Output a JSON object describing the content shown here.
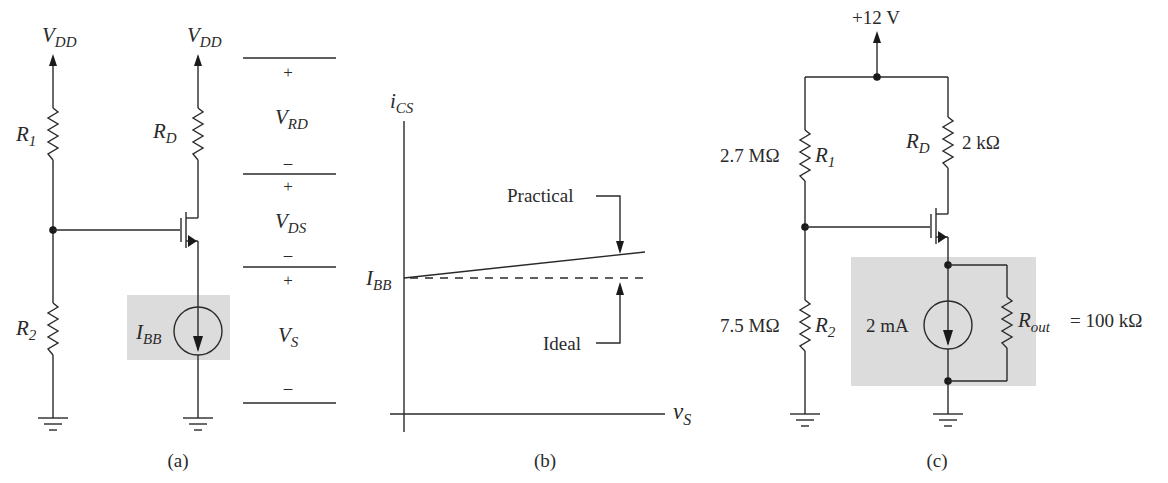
{
  "panel_a": {
    "caption": "(a)",
    "vdd_left": {
      "main": "V",
      "sub": "DD"
    },
    "vdd_right": {
      "main": "V",
      "sub": "DD"
    },
    "r1": {
      "main": "R",
      "sub": "1"
    },
    "r2": {
      "main": "R",
      "sub": "2"
    },
    "rd": {
      "main": "R",
      "sub": "D"
    },
    "ibb": {
      "main": "I",
      "sub": "BB"
    },
    "voltages": {
      "vrd": {
        "main": "V",
        "sub": "RD",
        "plus": "+",
        "minus": "–"
      },
      "vds": {
        "main": "V",
        "sub": "DS",
        "plus": "+",
        "minus": "–"
      },
      "vs": {
        "main": "V",
        "sub": "S",
        "plus": "+",
        "minus": "–"
      }
    },
    "shade_color": "#dcdcdc"
  },
  "panel_b": {
    "caption": "(b)",
    "y_axis": {
      "main": "i",
      "sub": "CS"
    },
    "x_axis": {
      "main": "v",
      "sub": "S"
    },
    "ibb": {
      "main": "I",
      "sub": "BB"
    },
    "practical_label": "Practical",
    "ideal_label": "Ideal"
  },
  "panel_c": {
    "caption": "(c)",
    "supply": "+12 V",
    "r1_value": "2.7 MΩ",
    "r1": {
      "main": "R",
      "sub": "1"
    },
    "r2_value": "7.5 MΩ",
    "r2": {
      "main": "R",
      "sub": "2"
    },
    "rd": {
      "main": "R",
      "sub": "D"
    },
    "rd_value": "2 kΩ",
    "source_value": "2 mA",
    "rout": {
      "main": "R",
      "sub": "out"
    },
    "rout_value": "= 100 kΩ",
    "shade_color": "#dcdcdc"
  }
}
